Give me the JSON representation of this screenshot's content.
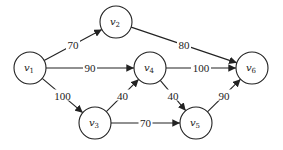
{
  "diagram": {
    "type": "directed-weighted-graph",
    "nodes": [
      {
        "id": "v1",
        "label": "v",
        "sub": "1",
        "x": 30,
        "y": 68
      },
      {
        "id": "v2",
        "label": "v",
        "sub": "2",
        "x": 116,
        "y": 22
      },
      {
        "id": "v3",
        "label": "v",
        "sub": "3",
        "x": 95,
        "y": 123
      },
      {
        "id": "v4",
        "label": "v",
        "sub": "4",
        "x": 150,
        "y": 68
      },
      {
        "id": "v5",
        "label": "v",
        "sub": "5",
        "x": 196,
        "y": 123
      },
      {
        "id": "v6",
        "label": "v",
        "sub": "6",
        "x": 252,
        "y": 68
      }
    ],
    "edges": [
      {
        "from": "v1",
        "to": "v2",
        "weight": "70"
      },
      {
        "from": "v1",
        "to": "v4",
        "weight": "90"
      },
      {
        "from": "v1",
        "to": "v3",
        "weight": "100"
      },
      {
        "from": "v2",
        "to": "v6",
        "weight": "80"
      },
      {
        "from": "v4",
        "to": "v6",
        "weight": "100"
      },
      {
        "from": "v3",
        "to": "v4",
        "weight": "40"
      },
      {
        "from": "v4",
        "to": "v5",
        "weight": "40"
      },
      {
        "from": "v3",
        "to": "v5",
        "weight": "70"
      },
      {
        "from": "v5",
        "to": "v6",
        "weight": "90"
      }
    ]
  }
}
